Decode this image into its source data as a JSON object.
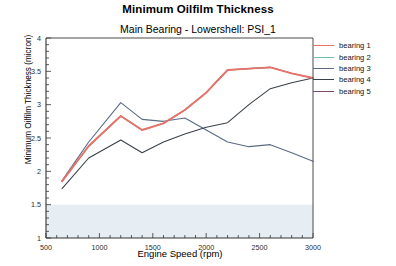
{
  "chart_data": {
    "type": "line",
    "title": "Minimum Oilfilm Thickness",
    "subtitle": "Main Bearing - Lowershell: PSI_1",
    "xlabel": "Engine Speed (rpm)",
    "ylabel": "Minimum Oilfilm Thickness (micron)",
    "xlim": [
      500,
      3000
    ],
    "ylim": [
      1,
      4
    ],
    "xticks": [
      500,
      1000,
      1500,
      2000,
      2500,
      3000
    ],
    "xtick_labels": [
      "500",
      "1000",
      "1500",
      "2000",
      "2500",
      "3000"
    ],
    "yticks": [
      1,
      1.5,
      2,
      2.5,
      3,
      3.5,
      4
    ],
    "ytick_labels": [
      "1",
      "1.5",
      "2",
      "2.5",
      "3",
      "3.5",
      "4"
    ],
    "grid": false,
    "legend_position": "right",
    "shaded_band": {
      "from": 1.0,
      "to": 1.5,
      "color": "#e7eef3"
    },
    "x": [
      650,
      900,
      1200,
      1400,
      1600,
      1800,
      2000,
      2200,
      2400,
      2600,
      2800,
      3000
    ],
    "series": [
      {
        "name": "bearing 1",
        "color": "#e8736a",
        "values": [
          1.85,
          2.38,
          2.83,
          2.62,
          2.72,
          2.92,
          3.18,
          3.52,
          3.54,
          3.56,
          3.47,
          3.4
        ]
      },
      {
        "name": "bearing 2",
        "color": "#6fbfae",
        "values": [
          1.85,
          2.38,
          2.83,
          2.62,
          2.72,
          2.92,
          3.18,
          3.52,
          3.54,
          3.56,
          3.47,
          3.4
        ]
      },
      {
        "name": "bearing 3",
        "color": "#5a6b86",
        "values": [
          1.86,
          2.44,
          3.03,
          2.78,
          2.75,
          2.8,
          2.62,
          2.44,
          2.37,
          2.4,
          2.28,
          2.15
        ]
      },
      {
        "name": "bearing 4",
        "color": "#3a4248",
        "values": [
          1.74,
          2.2,
          2.47,
          2.28,
          2.44,
          2.56,
          2.66,
          2.73,
          3.0,
          3.24,
          3.33,
          3.4
        ]
      },
      {
        "name": "bearing 5",
        "color": "#7b4a6e",
        "values": [
          1.85,
          2.38,
          2.83,
          2.62,
          2.72,
          2.92,
          3.18,
          3.52,
          3.54,
          3.56,
          3.47,
          3.4
        ]
      }
    ]
  },
  "legend": {
    "items": [
      {
        "label": "bearing 1",
        "color": "#e8736a"
      },
      {
        "label": "bearing 2",
        "color": "#6fbfae"
      },
      {
        "label": "bearing 3",
        "color": "#5a6b86"
      },
      {
        "label": "bearing 4",
        "color": "#3a4248"
      },
      {
        "label": "bearing 5",
        "color": "#7b4a6e"
      }
    ]
  }
}
